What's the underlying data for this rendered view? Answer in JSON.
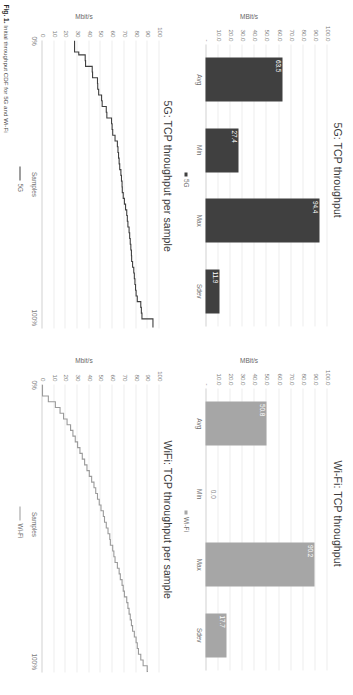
{
  "figure": {
    "caption_number": "Fig. 1.",
    "caption_text": "Initial throughput CDF for 5G and Wi-Fi",
    "colors": {
      "fiveg_bar": "#404040",
      "wifi_bar": "#a6a6a6",
      "fiveg_line": "#3f3f3f",
      "wifi_line": "#9a9a9a",
      "grid": "#ededed",
      "axis_text": "#7a7a7a"
    }
  },
  "chart_data": [
    {
      "id": "fiveg-bar",
      "type": "bar",
      "title": "5G: TCP throughput",
      "xlabel": "",
      "ylabel": "MBit/s",
      "ylim": [
        0,
        100
      ],
      "grid": true,
      "legend": [
        "5G"
      ],
      "legend_position": "bottom",
      "series_color": "#404040",
      "categories": [
        "Avg",
        "Min",
        "Max",
        "Sdev"
      ],
      "values": [
        63.5,
        27.4,
        94.4,
        11.9
      ],
      "data_labels": [
        "63.5",
        "27.4",
        "94.4",
        "11.9"
      ],
      "ytick_labels": [
        "100.0",
        "90.0",
        "80.0",
        "70.0",
        "60.0",
        "50.0",
        "40.0",
        "30.0",
        "20.0",
        "10.0",
        "-"
      ],
      "ytick_values": [
        100,
        90,
        80,
        70,
        60,
        50,
        40,
        30,
        20,
        10,
        0
      ]
    },
    {
      "id": "wifi-bar",
      "type": "bar",
      "title": "Wi-Fi: TCP throughput",
      "xlabel": "",
      "ylabel": "MBit/s",
      "ylim": [
        0,
        100
      ],
      "grid": true,
      "legend": [
        "Wi-Fi"
      ],
      "legend_position": "bottom",
      "series_color": "#a6a6a6",
      "categories": [
        "Avg",
        "Min",
        "Max",
        "Sdev"
      ],
      "values": [
        50.8,
        0.0,
        90.2,
        17.7
      ],
      "data_labels": [
        "50.8",
        "0.0",
        "90.2",
        "17.7"
      ],
      "ytick_labels": [
        "100.0",
        "90.0",
        "80.0",
        "70.0",
        "60.0",
        "50.0",
        "40.0",
        "30.0",
        "20.0",
        "10.0",
        "-"
      ],
      "ytick_values": [
        100,
        90,
        80,
        70,
        60,
        50,
        40,
        30,
        20,
        10,
        0
      ]
    },
    {
      "id": "fiveg-cdf",
      "type": "line",
      "title": "5G: TCP throughput per sample",
      "xlabel": "Samples",
      "ylabel": "Mbit/s",
      "ylim": [
        0,
        100
      ],
      "xlim": [
        0,
        100
      ],
      "xtick_labels": [
        "0%",
        "100%"
      ],
      "grid": true,
      "legend": [
        "5G"
      ],
      "legend_position": "bottom",
      "series_color": "#3f3f3f",
      "ytick_labels": [
        "100",
        "90",
        "80",
        "70",
        "60",
        "50",
        "40",
        "30",
        "20",
        "10",
        "0"
      ],
      "ytick_values": [
        100,
        90,
        80,
        70,
        60,
        50,
        40,
        30,
        20,
        10,
        0
      ],
      "x": [
        0,
        2,
        4,
        5,
        7,
        9,
        11,
        13,
        15,
        17,
        19,
        21,
        23,
        25,
        27,
        29,
        31,
        33,
        35,
        37,
        39,
        41,
        43,
        45,
        47,
        49,
        51,
        53,
        55,
        57,
        59,
        61,
        63,
        65,
        67,
        69,
        71,
        73,
        75,
        77,
        79,
        81,
        83,
        85,
        87,
        89,
        91,
        93,
        95,
        97,
        100
      ],
      "values": [
        27.4,
        27.4,
        31.0,
        36.5,
        36.8,
        42.5,
        42.8,
        47.0,
        47.2,
        48.0,
        50.5,
        51.0,
        54.5,
        55.0,
        59.0,
        59.5,
        60.0,
        62.0,
        64.0,
        64.5,
        65.0,
        65.5,
        66.0,
        67.0,
        67.5,
        68.0,
        68.2,
        69.0,
        70.0,
        71.0,
        72.0,
        72.5,
        73.0,
        74.0,
        74.5,
        75.0,
        75.5,
        76.0,
        76.2,
        77.0,
        78.0,
        78.5,
        79.0,
        79.5,
        80.0,
        81.0,
        84.0,
        84.5,
        85.0,
        94.4,
        94.4
      ]
    },
    {
      "id": "wifi-cdf",
      "type": "line",
      "title": "WiFi: TCP throughput per sample",
      "xlabel": "Samples",
      "ylabel": "Mbit/s",
      "ylim": [
        0,
        100
      ],
      "xlim": [
        0,
        100
      ],
      "xtick_labels": [
        "0%",
        "100%"
      ],
      "grid": true,
      "legend": [
        "Wi-Fi"
      ],
      "legend_position": "bottom",
      "series_color": "#9a9a9a",
      "ytick_labels": [
        "100",
        "90",
        "80",
        "70",
        "60",
        "50",
        "40",
        "30",
        "20",
        "10",
        "0"
      ],
      "ytick_values": [
        100,
        90,
        80,
        70,
        60,
        50,
        40,
        30,
        20,
        10,
        0
      ],
      "x": [
        0,
        2,
        4,
        6,
        8,
        10,
        12,
        14,
        16,
        18,
        20,
        22,
        24,
        26,
        28,
        30,
        32,
        34,
        36,
        38,
        40,
        42,
        44,
        46,
        48,
        50,
        52,
        54,
        56,
        58,
        60,
        62,
        64,
        66,
        68,
        70,
        72,
        74,
        76,
        78,
        80,
        82,
        84,
        86,
        88,
        90,
        92,
        94,
        96,
        98,
        100
      ],
      "values": [
        0.0,
        0.0,
        5.0,
        11.0,
        15.0,
        18.0,
        21.0,
        24.0,
        26.0,
        28.0,
        30.0,
        32.0,
        34.0,
        36.0,
        38.0,
        40.0,
        42.0,
        44.0,
        45.5,
        47.0,
        48.5,
        50.0,
        52.0,
        53.0,
        54.5,
        56.0,
        57.5,
        58.0,
        60.0,
        61.0,
        62.0,
        64.0,
        65.5,
        66.5,
        68.0,
        69.0,
        70.0,
        72.0,
        73.0,
        74.0,
        75.0,
        76.0,
        77.0,
        78.5,
        80.0,
        81.0,
        82.0,
        84.0,
        86.0,
        89.5,
        90.2
      ]
    }
  ]
}
